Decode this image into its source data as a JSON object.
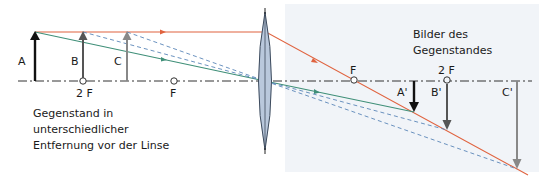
{
  "diagram": {
    "type": "converging-lens-ray-diagram",
    "colors": {
      "axis": "#333333",
      "ray_parallel": "#e0633f",
      "ray_center": "#3f8f78",
      "ray_dashed": "#5a86b8",
      "lens_fill": "#b9c8dc",
      "lens_stroke": "#3c4a5c",
      "image_panel": "#f1f4f8",
      "arrow_A": "#111111",
      "arrow_B": "#555555",
      "arrow_C": "#888888"
    },
    "objects": [
      {
        "label": "A"
      },
      {
        "label": "B"
      },
      {
        "label": "C"
      }
    ],
    "images": [
      {
        "label": "A'"
      },
      {
        "label": "B'"
      },
      {
        "label": "C'"
      }
    ],
    "focal_points": {
      "left_2f": "2 F",
      "left_f": "F",
      "right_f": "F",
      "right_2f": "2 F"
    },
    "captions": {
      "objects_line1": "Gegenstand in",
      "objects_line2": "unterschiedlicher",
      "objects_line3": "Entfernung vor der Linse",
      "images_line1": "Bilder des",
      "images_line2": "Gegenstandes"
    }
  }
}
